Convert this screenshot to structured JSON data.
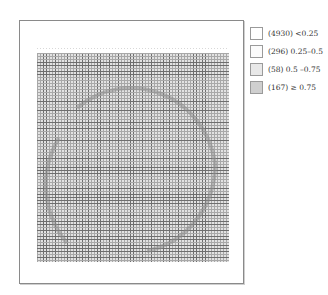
{
  "chart_data": {
    "type": "heatmap",
    "title": "",
    "xlabel": "",
    "ylabel": "",
    "grid": true,
    "legend_position": "right",
    "legend": [
      {
        "count": 4930,
        "range": "<0.25",
        "label": "(4930) <0.25",
        "color": "#ffffff"
      },
      {
        "count": 296,
        "range": "0.25–0.5",
        "label": "(296) 0.25–0.5",
        "color": "#fbfbfb"
      },
      {
        "count": 58,
        "range": "0.5 –0.75",
        "label": "(58) 0.5 –0.75",
        "color": "#e8e8e8"
      },
      {
        "count": 167,
        "range": "≥ 0.75",
        "label": "(167) ≥ 0.75",
        "color": "#cfcfcf"
      }
    ],
    "total_cells": 5451,
    "overlay_shape": "circle arc"
  },
  "colors": {
    "grid_bg": "#e2e2e2",
    "grid_line_dark": "#6e6e6e",
    "grid_line_light": "#a8a8a8",
    "arc": "#8c8c8c",
    "frame": "#8a8a8a"
  }
}
